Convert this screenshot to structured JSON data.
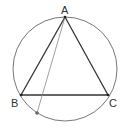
{
  "diagram": {
    "type": "geometry",
    "circle": {
      "cx": 65,
      "cy": 69,
      "r": 52,
      "stroke": "#777777"
    },
    "points": [
      {
        "id": "A",
        "label": "A",
        "x": 65,
        "y": 17,
        "lx": 61,
        "ly": 14
      },
      {
        "id": "B",
        "label": "B",
        "x": 21,
        "y": 95,
        "lx": 11,
        "ly": 107
      },
      {
        "id": "C",
        "label": "C",
        "x": 108,
        "y": 95,
        "lx": 109,
        "ly": 107
      },
      {
        "id": "D",
        "label": "",
        "x": 37,
        "y": 113
      }
    ],
    "triangle": {
      "vertices": [
        "A",
        "B",
        "C"
      ],
      "stroke": "#333333"
    },
    "extra_segment": {
      "from": "A",
      "to": "D",
      "stroke": "#888888"
    }
  }
}
